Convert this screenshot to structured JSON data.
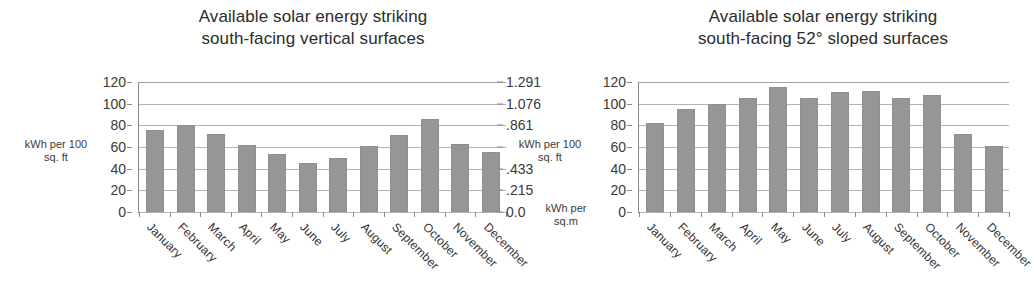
{
  "chart_data": [
    {
      "type": "bar",
      "title": "Available solar energy striking south-facing vertical surfaces",
      "title_line1": "Available solar energy striking",
      "title_line2": "south-facing vertical surfaces",
      "categories": [
        "January",
        "February",
        "March",
        "April",
        "May",
        "June",
        "July",
        "August",
        "September",
        "October",
        "November",
        "December"
      ],
      "values": [
        76,
        80,
        72,
        62,
        54,
        45,
        50,
        61,
        71,
        86,
        63,
        55
      ],
      "xlabel": "",
      "ylabel": "kWh per 100 sq. ft",
      "ylabel_line1": "kWh per 100",
      "ylabel_line2": "sq. ft",
      "ylim": [
        0,
        120
      ],
      "yticks": [
        "120",
        "100",
        "80",
        "60",
        "40",
        "20",
        "0"
      ],
      "ytick_values": [
        120,
        100,
        80,
        60,
        40,
        20,
        0
      ],
      "secondary_ylabel": "kWh per sq.m",
      "secondary_ylabel_line1": "kWh per",
      "secondary_ylabel_line2": "sq.m",
      "secondary_yticks": [
        "1.291",
        "1.076",
        ".861",
        "",
        ".433",
        ".215",
        "0.0"
      ],
      "grid": true,
      "legend": "none",
      "bar_color": "#969696"
    },
    {
      "type": "bar",
      "title": "Available solar energy striking south-facing 52° sloped surfaces",
      "title_line1": "Available solar energy striking",
      "title_line2": "south-facing 52° sloped surfaces",
      "categories": [
        "January",
        "February",
        "March",
        "April",
        "May",
        "June",
        "July",
        "August",
        "September",
        "October",
        "November",
        "December"
      ],
      "values": [
        82,
        95,
        100,
        105,
        115,
        105,
        111,
        112,
        105,
        108,
        72,
        61
      ],
      "xlabel": "",
      "ylabel": "kWh per 100 sq. ft",
      "ylabel_line1": "kWh per 100",
      "ylabel_line2": "sq. ft",
      "ylim": [
        0,
        120
      ],
      "yticks": [
        "120",
        "100",
        "80",
        "60",
        "40",
        "20",
        "0"
      ],
      "ytick_values": [
        120,
        100,
        80,
        60,
        40,
        20,
        0
      ],
      "grid": true,
      "legend": "none",
      "bar_color": "#969696"
    }
  ],
  "colors": {
    "bar": "#969696",
    "gridline": "#b3b3b3",
    "axis": "#8a8a8a",
    "text": "#3a3a3a",
    "background": "#ffffff"
  }
}
